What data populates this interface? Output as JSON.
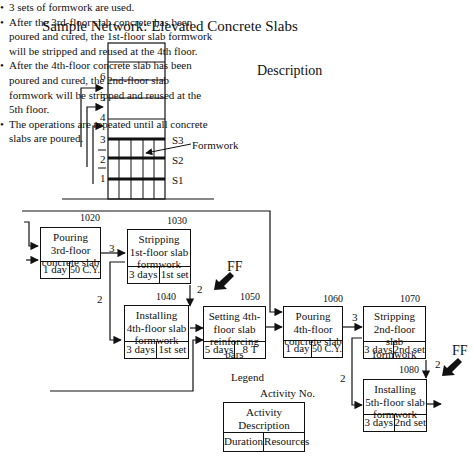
{
  "title": "Sample Network: Elevated Concrete Slabs",
  "building": {
    "floor_labels": [
      "1",
      "2",
      "3",
      "4",
      "5",
      "6"
    ],
    "slab_labels": [
      "S1",
      "S2",
      "S3"
    ],
    "formwork_label": "Formwork"
  },
  "description": {
    "heading": "Description",
    "bullets": [
      "3 sets of formwork are used.",
      "After the 3rd-floor slab concrete has been poured and cured, the 1st-floor slab formwork will be stripped and reused at the 4th floor.",
      "After the 4th-floor concrete slab has been poured and cured, the 2nd-floor slab formwork will be stripped and reused at the 5th floor.",
      "The operations are repeated until all concrete slabs are poured."
    ]
  },
  "activities": [
    {
      "id": "1020",
      "desc": [
        "Pouring",
        "3rd-floor",
        "concrete slab"
      ],
      "duration": "1 day",
      "resources": "50 C.Y."
    },
    {
      "id": "1030",
      "desc": [
        "Stripping",
        "1st-floor slab",
        "formwork"
      ],
      "duration": "3 days",
      "resources": "1st set"
    },
    {
      "id": "1040",
      "desc": [
        "Installing",
        "4th-floor slab",
        "formwork"
      ],
      "duration": "3 days",
      "resources": "1st set"
    },
    {
      "id": "1050",
      "desc": [
        "Setting 4th-",
        "floor slab",
        "reinforcing bars"
      ],
      "duration": "5 days",
      "resources": "8 T"
    },
    {
      "id": "1060",
      "desc": [
        "Pouring",
        "4th-floor",
        "concrete slab"
      ],
      "duration": "1 day",
      "resources": "50 C.Y."
    },
    {
      "id": "1070",
      "desc": [
        "Stripping",
        "2nd-floor slab",
        "formwork"
      ],
      "duration": "3 days",
      "resources": "2nd set"
    },
    {
      "id": "1080",
      "desc": [
        "Installing",
        "5th-floor slab",
        "formwork"
      ],
      "duration": "3 days",
      "resources": "2nd set"
    }
  ],
  "lags": {
    "l1020_1030": "3",
    "l1020_1040": "2",
    "l1030_1040": "2",
    "l1060_1070": "3",
    "l1060_1080": "2",
    "l1070_1080": "2"
  },
  "ff_labels": [
    "FF",
    "FF"
  ],
  "legend": {
    "heading": "Legend",
    "activity_no": "Activity No.",
    "desc": [
      "Activity",
      "Description"
    ],
    "duration": "Duration",
    "resources": "Resources"
  }
}
